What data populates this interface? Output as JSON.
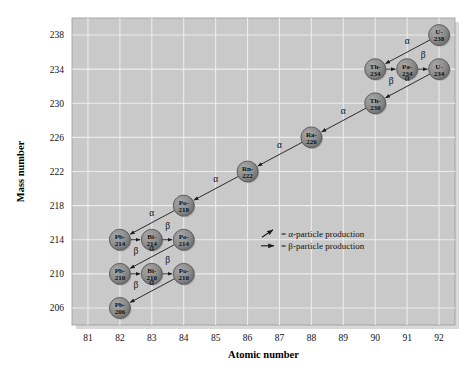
{
  "chart_data": {
    "type": "scatter",
    "title": "",
    "xlabel": "Atomic number",
    "ylabel": "Mass number",
    "xlim": [
      80.5,
      92.5
    ],
    "ylim": [
      204,
      240
    ],
    "xticks": [
      81,
      82,
      83,
      84,
      85,
      86,
      87,
      88,
      89,
      90,
      91,
      92
    ],
    "yticks": [
      206,
      210,
      214,
      218,
      222,
      226,
      230,
      234,
      238
    ],
    "grid": true,
    "legend_position": "inside-right",
    "plot_bg": "#c9c9c9",
    "node_fill": "#8d8d8d",
    "nodes": [
      {
        "id": "U-238",
        "symbol": "U-",
        "mass": "238",
        "z": 92,
        "a": 238
      },
      {
        "id": "Th-234",
        "symbol": "Th-",
        "mass": "234",
        "z": 90,
        "a": 234
      },
      {
        "id": "Pa-234",
        "symbol": "Pa-",
        "mass": "234",
        "z": 91,
        "a": 234
      },
      {
        "id": "U-234",
        "symbol": "U-",
        "mass": "234",
        "z": 92,
        "a": 234
      },
      {
        "id": "Th-230",
        "symbol": "Th-",
        "mass": "230",
        "z": 90,
        "a": 230
      },
      {
        "id": "Ra-226",
        "symbol": "Ra-",
        "mass": "226",
        "z": 88,
        "a": 226
      },
      {
        "id": "Rn-222",
        "symbol": "Rn-",
        "mass": "222",
        "z": 86,
        "a": 222
      },
      {
        "id": "Po-218",
        "symbol": "Po-",
        "mass": "218",
        "z": 84,
        "a": 218
      },
      {
        "id": "Pb-214",
        "symbol": "Pb-",
        "mass": "214",
        "z": 82,
        "a": 214
      },
      {
        "id": "Bi-214",
        "symbol": "Bi-",
        "mass": "214",
        "z": 83,
        "a": 214
      },
      {
        "id": "Po-214",
        "symbol": "Po-",
        "mass": "214",
        "z": 84,
        "a": 214
      },
      {
        "id": "Pb-210",
        "symbol": "Pb-",
        "mass": "210",
        "z": 82,
        "a": 210
      },
      {
        "id": "Bi-210",
        "symbol": "Bi-",
        "mass": "210",
        "z": 83,
        "a": 210
      },
      {
        "id": "Po-210",
        "symbol": "Po-",
        "mass": "210",
        "z": 84,
        "a": 210
      },
      {
        "id": "Pb-206",
        "symbol": "Pb-",
        "mass": "206",
        "z": 82,
        "a": 206
      }
    ],
    "decays": [
      {
        "from": "U-238",
        "to": "Th-234",
        "type": "alpha",
        "label": "α",
        "lx": 91.0,
        "ly": 236.9
      },
      {
        "from": "Th-234",
        "to": "Pa-234",
        "type": "beta",
        "label": "β",
        "lx": 90.5,
        "ly": 232.3
      },
      {
        "from": "Pa-234",
        "to": "U-234",
        "type": "beta",
        "label": "β",
        "lx": 91.5,
        "ly": 235.3
      },
      {
        "from": "U-234",
        "to": "Th-230",
        "type": "alpha",
        "label": "α",
        "lx": 91.0,
        "ly": 232.6
      },
      {
        "from": "Th-230",
        "to": "Ra-226",
        "type": "alpha",
        "label": "α",
        "lx": 89.0,
        "ly": 228.8
      },
      {
        "from": "Ra-226",
        "to": "Rn-222",
        "type": "alpha",
        "label": "α",
        "lx": 87.0,
        "ly": 224.8
      },
      {
        "from": "Rn-222",
        "to": "Po-218",
        "type": "alpha",
        "label": "α",
        "lx": 85.0,
        "ly": 220.8
      },
      {
        "from": "Po-218",
        "to": "Pb-214",
        "type": "alpha",
        "label": "α",
        "lx": 83.0,
        "ly": 216.8
      },
      {
        "from": "Pb-214",
        "to": "Bi-214",
        "type": "beta",
        "label": "β",
        "lx": 82.5,
        "ly": 212.3
      },
      {
        "from": "Bi-214",
        "to": "Po-214",
        "type": "beta",
        "label": "β",
        "lx": 83.5,
        "ly": 215.3
      },
      {
        "from": "Po-214",
        "to": "Pb-210",
        "type": "alpha",
        "label": "α",
        "lx": 83.0,
        "ly": 212.7
      },
      {
        "from": "Pb-210",
        "to": "Bi-210",
        "type": "beta",
        "label": "β",
        "lx": 82.5,
        "ly": 208.3
      },
      {
        "from": "Bi-210",
        "to": "Po-210",
        "type": "beta",
        "label": "β",
        "lx": 83.5,
        "ly": 211.3
      },
      {
        "from": "Po-210",
        "to": "Pb-206",
        "type": "alpha",
        "label": "α",
        "lx": 83.0,
        "ly": 208.7
      }
    ]
  },
  "legend": {
    "alpha_text": "= α-particle production",
    "beta_text": "= β-particle production"
  }
}
